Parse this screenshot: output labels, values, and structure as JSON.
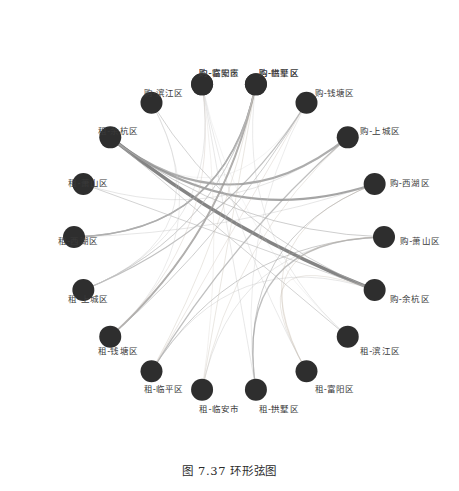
{
  "figure": {
    "caption": "图 7.37  环形弦图",
    "caption_number": "图 7.37",
    "caption_title": "环形弦图"
  },
  "style": {
    "node_color": "#2e2e2e",
    "chord_color": "#808080",
    "chord_color_light": "#b9b9b9",
    "chord_color_tan": "#b9aa9a",
    "background": "#ffffff",
    "label_color": "#3a3a3a"
  },
  "chart_data": {
    "type": "chord",
    "title": "环形弦图",
    "layout": {
      "center_x": 229,
      "center_y": 237,
      "ring_radius": 155,
      "node_radius": 11,
      "grid": false,
      "legend": "none",
      "node_count": 18
    },
    "nodes": [
      {
        "id": 0,
        "label": "购-临安市",
        "angle_deg": -100,
        "group": "购"
      },
      {
        "id": 1,
        "label": "购-临平区",
        "angle_deg": -80,
        "group": "购"
      },
      {
        "id": 2,
        "label": "购-钱塘区",
        "angle_deg": -60,
        "group": "购"
      },
      {
        "id": 3,
        "label": "购-上城区",
        "angle_deg": -40,
        "group": "购"
      },
      {
        "id": 4,
        "label": "购-西湖区",
        "angle_deg": -20,
        "group": "购"
      },
      {
        "id": 5,
        "label": "购-萧山区",
        "angle_deg": 0,
        "group": "购"
      },
      {
        "id": 6,
        "label": "购-余杭区",
        "angle_deg": 20,
        "group": "购"
      },
      {
        "id": 7,
        "label": "租-滨江区",
        "angle_deg": 40,
        "group": "租"
      },
      {
        "id": 8,
        "label": "租-富阳区",
        "angle_deg": 60,
        "group": "租"
      },
      {
        "id": 9,
        "label": "租-拱墅区",
        "angle_deg": 80,
        "group": "租"
      },
      {
        "id": 10,
        "label": "租-临安市",
        "angle_deg": 100,
        "group": "租"
      },
      {
        "id": 11,
        "label": "租-临平区",
        "angle_deg": 120,
        "group": "租"
      },
      {
        "id": 12,
        "label": "租-钱塘区",
        "angle_deg": 140,
        "group": "租"
      },
      {
        "id": 13,
        "label": "租-上城区",
        "angle_deg": 160,
        "group": "租"
      },
      {
        "id": 14,
        "label": "租-西湖区",
        "angle_deg": 180,
        "group": "租"
      },
      {
        "id": 15,
        "label": "租-萧山区",
        "angle_deg": 200,
        "group": "租"
      },
      {
        "id": 16,
        "label": "租-余杭区",
        "angle_deg": 220,
        "group": "租"
      },
      {
        "id": 17,
        "label": "购-滨江区",
        "angle_deg": 240,
        "group": "购"
      },
      {
        "id": 18,
        "label": "购-富阳区",
        "angle_deg": 260,
        "group": "购"
      },
      {
        "id": 19,
        "label": "购-拱墅区",
        "angle_deg": 280,
        "group": "购"
      }
    ],
    "links": [
      {
        "source": 6,
        "target": 16,
        "weight": 10,
        "color": "#7a7a7a"
      },
      {
        "source": 4,
        "target": 16,
        "weight": 7,
        "color": "#8a8a8a"
      },
      {
        "source": 3,
        "target": 16,
        "weight": 6,
        "color": "#8a8a8a"
      },
      {
        "source": 19,
        "target": 12,
        "weight": 6,
        "color": "#8a8a8a"
      },
      {
        "source": 19,
        "target": 14,
        "weight": 5,
        "color": "#939393"
      },
      {
        "source": 1,
        "target": 14,
        "weight": 4,
        "color": "#9a9a9a"
      },
      {
        "source": 2,
        "target": 13,
        "weight": 4,
        "color": "#9a9a9a"
      },
      {
        "source": 3,
        "target": 11,
        "weight": 4,
        "color": "#9a9a9a"
      },
      {
        "source": 5,
        "target": 9,
        "weight": 4,
        "color": "#9a9a9a"
      },
      {
        "source": 5,
        "target": 11,
        "weight": 3,
        "color": "#a3a3a3"
      },
      {
        "source": 4,
        "target": 9,
        "weight": 3,
        "color": "#a3a3a3"
      },
      {
        "source": 17,
        "target": 6,
        "weight": 3,
        "color": "#b0b0b0"
      },
      {
        "source": 15,
        "target": 6,
        "weight": 3,
        "color": "#b0b0b0"
      },
      {
        "source": 16,
        "target": 7,
        "weight": 3,
        "color": "#b0b0b0"
      },
      {
        "source": 16,
        "target": 5,
        "weight": 3,
        "color": "#a8a8a8"
      },
      {
        "source": 12,
        "target": 2,
        "weight": 3,
        "color": "#a8a8a8"
      },
      {
        "source": 13,
        "target": 1,
        "weight": 3,
        "color": "#a8a8a8"
      },
      {
        "source": 9,
        "target": 0,
        "weight": 2,
        "color": "#bdbdbd"
      },
      {
        "source": 19,
        "target": 10,
        "weight": 2,
        "color": "#c2b8ab"
      },
      {
        "source": 19,
        "target": 11,
        "weight": 2,
        "color": "#c2b8ab"
      },
      {
        "source": 0,
        "target": 12,
        "weight": 2,
        "color": "#c6bdb2"
      },
      {
        "source": 1,
        "target": 12,
        "weight": 2,
        "color": "#c6bdb2"
      },
      {
        "source": 2,
        "target": 11,
        "weight": 2,
        "color": "#c6bdb2"
      },
      {
        "source": 4,
        "target": 8,
        "weight": 2,
        "color": "#c0b6a8"
      },
      {
        "source": 5,
        "target": 8,
        "weight": 2,
        "color": "#c0b6a8"
      },
      {
        "source": 6,
        "target": 8,
        "weight": 2,
        "color": "#c4bbb0"
      },
      {
        "source": 3,
        "target": 10,
        "weight": 2,
        "color": "#c4bbb0"
      },
      {
        "source": 18,
        "target": 13,
        "weight": 2,
        "color": "#bfbfbf"
      },
      {
        "source": 17,
        "target": 13,
        "weight": 2,
        "color": "#bfbfbf"
      },
      {
        "source": 15,
        "target": 3,
        "weight": 2,
        "color": "#b6b6b6"
      },
      {
        "source": 14,
        "target": 4,
        "weight": 2,
        "color": "#b6b6b6"
      },
      {
        "source": 7,
        "target": 1,
        "weight": 2,
        "color": "#c0c0c0"
      },
      {
        "source": 8,
        "target": 0,
        "weight": 2,
        "color": "#c0c0c0"
      },
      {
        "source": 10,
        "target": 5,
        "weight": 2,
        "color": "#bababa"
      },
      {
        "source": 11,
        "target": 6,
        "weight": 2,
        "color": "#bababa"
      },
      {
        "source": 9,
        "target": 2,
        "weight": 2,
        "color": "#c8c8c8"
      },
      {
        "source": 12,
        "target": 17,
        "weight": 2,
        "color": "#c8c8c8"
      },
      {
        "source": 13,
        "target": 19,
        "weight": 1,
        "color": "#cfcfcf"
      },
      {
        "source": 14,
        "target": 1,
        "weight": 1,
        "color": "#cfcfcf"
      },
      {
        "source": 7,
        "target": 18,
        "weight": 1,
        "color": "#d2d2d2"
      },
      {
        "source": 10,
        "target": 0,
        "weight": 1,
        "color": "#cdc6bd"
      },
      {
        "source": 16,
        "target": 2,
        "weight": 1,
        "color": "#d0d0d0"
      }
    ]
  }
}
